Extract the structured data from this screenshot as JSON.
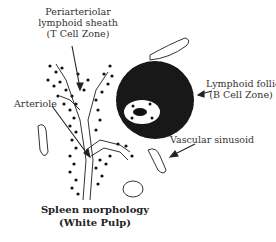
{
  "diagram": {
    "labels": {
      "pals_line1": "Periarteriolar",
      "pals_line2": "lymphoid sheath",
      "pals_line3": "(T Cell Zone)",
      "arteriole": "Arteriole",
      "follicle_line1": "Lymphoid follicle",
      "follicle_line2": "(B Cell Zone)",
      "sinusoid": "Vascular sinusoid"
    },
    "caption": {
      "line1": "Spleen morphology",
      "line2": "(White Pulp)"
    },
    "colors": {
      "ink": "#222222",
      "background": "#ffffff"
    }
  }
}
